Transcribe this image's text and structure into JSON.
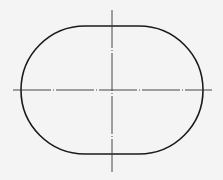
{
  "diagram": {
    "type": "technical-drawing",
    "colors": {
      "background": "#f4f4f4",
      "outline": "#1a1a1a",
      "centerline": "#333333"
    },
    "shape": {
      "kind": "obround",
      "left": 21,
      "right": 203,
      "top": 26,
      "bottom": 154,
      "radius": 64
    },
    "centerlines": {
      "horizontal": {
        "y": 90,
        "x1": 13,
        "x2": 212
      },
      "vertical": {
        "x": 112,
        "y1": 10,
        "y2": 172
      }
    }
  }
}
